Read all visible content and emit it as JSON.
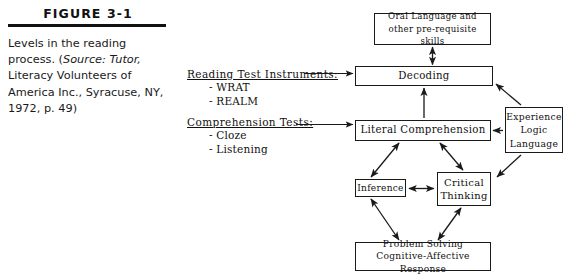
{
  "figure": {
    "label": "FIGURE 3-1",
    "caption_line1": "Levels in the reading",
    "caption_line2_pre": "process. (",
    "caption_line2_italic": "Source: Tutor,",
    "caption_line3": "Literacy Volunteers of",
    "caption_line4": "America Inc., Syracuse, NY,",
    "caption_line5": "1972, p. 49)"
  },
  "annotations": [
    {
      "heading": "Reading Test Instruments:",
      "items": [
        "- WRAT",
        "- REALM"
      ]
    },
    {
      "heading": "Comprehension Tests:",
      "items": [
        "- Cloze",
        "- Listening"
      ]
    }
  ],
  "diagram": {
    "nodes": {
      "oral": {
        "line1": "Oral Language and",
        "line2": "other pre-requisite skills"
      },
      "decoding": {
        "line1": "Decoding"
      },
      "literal": {
        "line1": "Literal Comprehension"
      },
      "experience": {
        "line1": "Experience",
        "line2": "Logic",
        "line3": "Language"
      },
      "inference": {
        "line1": "Inference"
      },
      "critical": {
        "line1": "Critical",
        "line2": "Thinking"
      },
      "problem": {
        "line1": "Problem Solving",
        "line2": "Cognitive-Affective Response"
      }
    },
    "edges": [
      {
        "from": "decoding",
        "to": "oral",
        "style": "double-headed",
        "orientation": "vertical"
      },
      {
        "from": "literal",
        "to": "decoding",
        "style": "single-headed",
        "orientation": "vertical"
      },
      {
        "from": "annotation-reading-test-instruments",
        "to": "decoding",
        "style": "single-headed",
        "orientation": "horizontal"
      },
      {
        "from": "annotation-comprehension-tests",
        "to": "literal",
        "style": "single-headed",
        "orientation": "horizontal"
      },
      {
        "from": "experience",
        "to": "decoding",
        "style": "single-headed",
        "orientation": "diagonal"
      },
      {
        "from": "experience",
        "to": "literal",
        "style": "single-headed",
        "orientation": "horizontal"
      },
      {
        "from": "experience",
        "to": "critical",
        "style": "single-headed",
        "orientation": "diagonal"
      },
      {
        "from": "literal",
        "to": "inference",
        "style": "double-headed",
        "orientation": "diagonal"
      },
      {
        "from": "literal",
        "to": "critical",
        "style": "double-headed",
        "orientation": "diagonal"
      },
      {
        "from": "inference",
        "to": "critical",
        "style": "double-headed",
        "orientation": "horizontal"
      },
      {
        "from": "inference",
        "to": "problem",
        "style": "double-headed",
        "orientation": "diagonal"
      },
      {
        "from": "critical",
        "to": "problem",
        "style": "double-headed",
        "orientation": "diagonal"
      }
    ]
  },
  "colors": {
    "ink": "#1a1a1a",
    "rule": "#111111",
    "background": "#ffffff"
  }
}
